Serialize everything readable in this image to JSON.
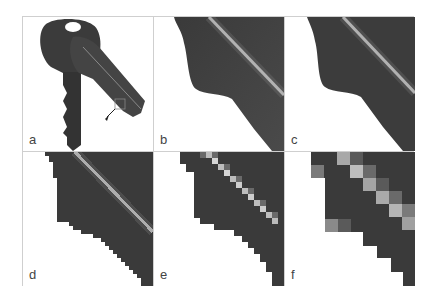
{
  "figure": {
    "panels": [
      {
        "id": "a",
        "label": "a",
        "content": "photo of two keys with small inset marker and arrow"
      },
      {
        "id": "b",
        "label": "b",
        "content": "close-up of key edge, full resolution"
      },
      {
        "id": "c",
        "label": "c",
        "content": "close-up of key edge, slightly reduced resolution"
      },
      {
        "id": "d",
        "label": "d",
        "content": "close-up of key edge, pixelated (fine)"
      },
      {
        "id": "e",
        "label": "e",
        "content": "close-up of key edge, pixelated (medium)"
      },
      {
        "id": "f",
        "label": "f",
        "content": "close-up of key edge, pixelated (coarse)"
      }
    ]
  },
  "colors": {
    "metal_dark": "#3a3a3a",
    "metal_mid": "#555555",
    "highlight": "#d8d8d8",
    "border": "#cfcfcf",
    "label": "#444444"
  }
}
